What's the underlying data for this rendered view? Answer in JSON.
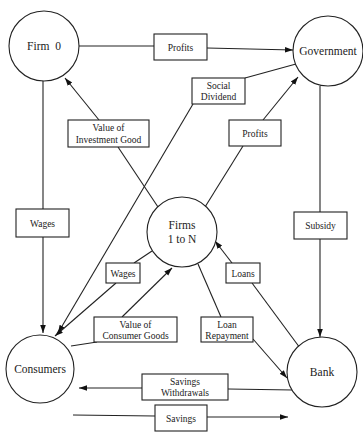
{
  "diagram": {
    "type": "flow-of-funds",
    "nodes": [
      {
        "id": "firm0",
        "label": "Firm  0"
      },
      {
        "id": "government",
        "label": "Government"
      },
      {
        "id": "firms",
        "label_line1": "Firms",
        "label_line2": "1 to N"
      },
      {
        "id": "consumers",
        "label": "Consumers"
      },
      {
        "id": "bank",
        "label": "Bank"
      }
    ],
    "edges": [
      {
        "from": "firm0",
        "to": "government",
        "label": "Profits"
      },
      {
        "from": "government",
        "to": "consumers",
        "label_line1": "Social",
        "label_line2": "Dividend"
      },
      {
        "from": "firms",
        "to": "government",
        "label": "Profits"
      },
      {
        "from": "firms",
        "to": "firm0",
        "label_line1": "Value of",
        "label_line2": "Investment Good"
      },
      {
        "from": "firm0",
        "to": "consumers",
        "label": "Wages"
      },
      {
        "from": "government",
        "to": "bank",
        "label": "Subsidy"
      },
      {
        "from": "firms",
        "to": "consumers",
        "label": "Wages"
      },
      {
        "from": "bank",
        "to": "firms",
        "label": "Loans"
      },
      {
        "from": "consumers",
        "to": "firms",
        "label_line1": "Value of",
        "label_line2": "Consumer Goods"
      },
      {
        "from": "firms",
        "to": "bank",
        "label_line1": "Loan",
        "label_line2": "Repayment"
      },
      {
        "from": "bank",
        "to": "consumers",
        "label_line1": "Savings",
        "label_line2": "Withdrawals"
      },
      {
        "from": "consumers",
        "to": "bank",
        "label": "Savings"
      }
    ]
  }
}
